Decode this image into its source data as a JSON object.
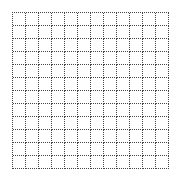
{
  "board": {
    "rows": 12,
    "cols": 12,
    "cell_size_px": 13,
    "line_style": "dotted",
    "line_color": "#444444",
    "background_color": "#ffffff",
    "cells": []
  }
}
